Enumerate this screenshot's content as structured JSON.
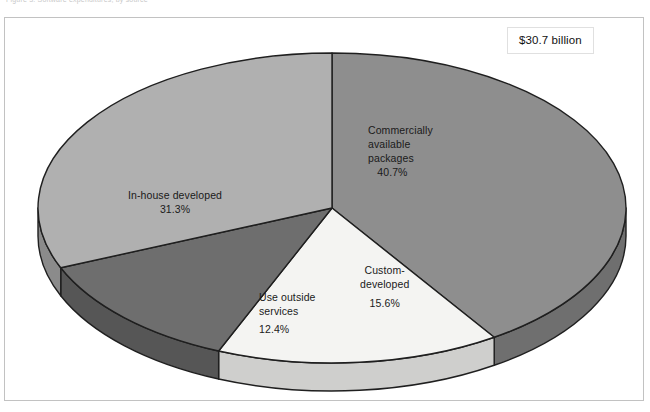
{
  "page": {
    "top_caption": "Figure 3. Software expenditures, by source",
    "background_color": "#ffffff",
    "frame_border_color": "#c2c2c2"
  },
  "total_callout": {
    "label": "$30.7 billion"
  },
  "chart_data": {
    "type": "pie",
    "title": "",
    "subtitle": "",
    "xlabel": "",
    "ylabel": "",
    "legend_position": "none",
    "grid": false,
    "style": "3d-exploded-none",
    "total_label": "$30.7 billion",
    "units": "percent of total",
    "categories": [
      "Commercially available packages",
      "In-house developed",
      "Custom-developed",
      "Use outside services"
    ],
    "values": [
      40.7,
      31.3,
      15.6,
      12.4
    ],
    "slices": [
      {
        "name": "Commercially available packages",
        "label_lines": [
          "Commercially",
          "available",
          "packages"
        ],
        "value": 40.7,
        "value_label": "40.7%",
        "color": "#8e8e8e",
        "side_color": "#6f6f6f",
        "start_angle": 0,
        "end_angle": 146.52
      },
      {
        "name": "Custom-developed",
        "label_lines": [
          "Custom-",
          "developed"
        ],
        "value": 15.6,
        "value_label": "15.6%",
        "color": "#f4f4f2",
        "side_color": "#cfcfcd",
        "start_angle": 146.52,
        "end_angle": 202.68
      },
      {
        "name": "Use outside services",
        "label_lines": [
          "Use outside",
          "services"
        ],
        "value": 12.4,
        "value_label": "12.4%",
        "color": "#6e6e6e",
        "side_color": "#565656",
        "start_angle": 202.68,
        "end_angle": 247.32
      },
      {
        "name": "In-house developed",
        "label_lines": [
          "In-house developed"
        ],
        "value": 31.3,
        "value_label": "31.3%",
        "color": "#b0b0b0",
        "side_color": "#8b8b8b",
        "start_angle": 247.32,
        "end_angle": 360
      }
    ],
    "outline_color": "#1f1f1f"
  },
  "labels": {
    "commercial": {
      "line1": "Commercially",
      "line2": "available",
      "line3": "packages",
      "pct": "40.7%"
    },
    "inhouse": {
      "line1": "In-house developed",
      "pct": "31.3%"
    },
    "custom": {
      "line1": "Custom-",
      "line2": "developed",
      "pct": "15.6%"
    },
    "outside": {
      "line1": "Use outside",
      "line2": "services",
      "pct": "12.4%"
    }
  }
}
